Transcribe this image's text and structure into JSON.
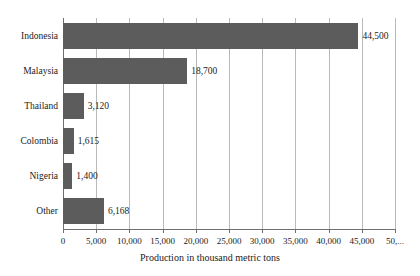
{
  "chart_data": {
    "type": "bar",
    "orientation": "horizontal",
    "title": "",
    "subtitle": "",
    "categories": [
      "Indonesia",
      "Malaysia",
      "Thailand",
      "Colombia",
      "Nigeria",
      "Other"
    ],
    "values": [
      44500,
      18700,
      3120,
      1615,
      1400,
      6168
    ],
    "value_labels": [
      "44,500",
      "18,700",
      "3,120",
      "1,615",
      "1,400",
      "6,168"
    ],
    "xlabel": "Production in thousand metric tons",
    "ylabel": "",
    "xlim": [
      0,
      50000
    ],
    "xticks": [
      0,
      5000,
      10000,
      15000,
      20000,
      25000,
      30000,
      35000,
      40000,
      45000,
      50000
    ],
    "xtick_labels": [
      "0",
      "5,000",
      "10,000",
      "15,000",
      "20,000",
      "25,000",
      "30,000",
      "35,000",
      "40,000",
      "45,000",
      "50,..."
    ],
    "grid": true,
    "grid_axis": "x",
    "legend": false,
    "legend_position": "none",
    "colors": {
      "bar": "#5c5c5c",
      "gridline": "#b9b9b9",
      "axis": "#6f6f6f",
      "text": "#1b1b1b",
      "background": "#ffffff"
    }
  }
}
